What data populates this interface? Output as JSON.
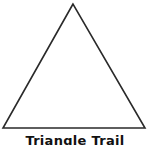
{
  "figure": {
    "shape": "triangle",
    "caption": "Triangle Trail",
    "stroke_color": "#2a2a2a",
    "fill_color": "#ffffff",
    "vertices": {
      "apex": [
        73,
        4
      ],
      "bottom_left": [
        3,
        128
      ],
      "bottom_right": [
        145,
        128
      ]
    }
  }
}
